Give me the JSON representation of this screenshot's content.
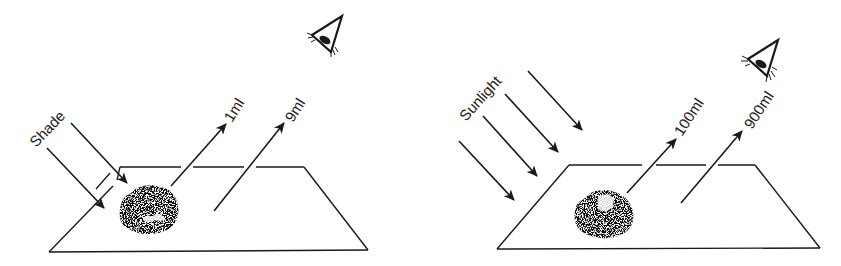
{
  "colors": {
    "ink": "#1a1a1a",
    "background": "#ffffff"
  },
  "panels": [
    {
      "name": "shade",
      "light_label": "Shade",
      "incoming_arrows": 2,
      "outgoing": [
        {
          "label": "1ml"
        },
        {
          "label": "9ml"
        }
      ],
      "icons": [
        "eye-icon",
        "rock-icon"
      ]
    },
    {
      "name": "sunlight",
      "light_label": "Sunlight",
      "incoming_arrows": 4,
      "outgoing": [
        {
          "label": "100ml"
        },
        {
          "label": "900ml"
        }
      ],
      "icons": [
        "eye-icon",
        "rock-icon"
      ]
    }
  ]
}
